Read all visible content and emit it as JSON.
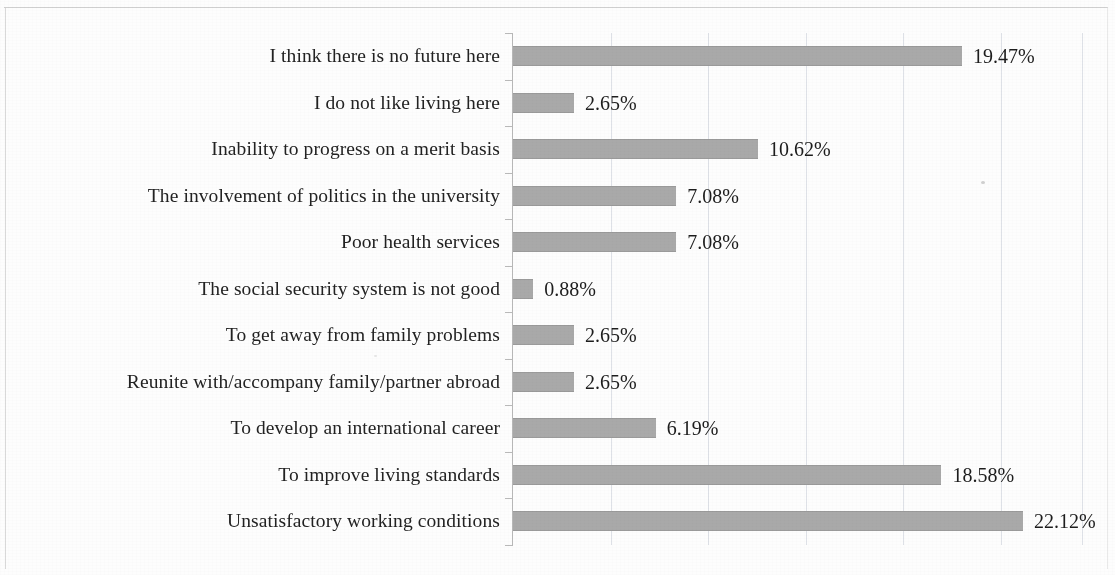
{
  "chart_data": {
    "type": "bar",
    "orientation": "horizontal",
    "title": "",
    "subtitle": "",
    "xlabel": "",
    "ylabel": "",
    "categories": [
      "I think there is no future here",
      "I do not like living here",
      "Inability to progress on a merit basis",
      "The involvement of politics in the university",
      "Poor health services",
      "The social security system is not good",
      "To get away from family problems",
      "Reunite with/accompany family/partner abroad",
      "To develop an international career",
      "To improve living standards",
      "Unsatisfactory working conditions"
    ],
    "values": [
      19.47,
      2.65,
      10.62,
      7.08,
      7.08,
      0.88,
      2.65,
      2.65,
      6.19,
      18.58,
      22.12
    ],
    "value_labels": [
      "19.47%",
      "2.65%",
      "10.62%",
      "7.08%",
      "7.08%",
      "0.88%",
      "2.65%",
      "2.65%",
      "6.19%",
      "18.58%",
      "22.12%"
    ],
    "unit": "%",
    "xlim": [
      0,
      24.675
    ],
    "gridline_values": [
      4.23,
      8.46,
      12.69,
      16.92,
      21.15,
      24.67
    ],
    "grid": true,
    "grid_axis": "x",
    "legend": false,
    "tick_labels_x": [],
    "series": [
      {
        "name": "Share of respondents",
        "color": "#a9a9a9",
        "values": [
          19.47,
          2.65,
          10.62,
          7.08,
          7.08,
          0.88,
          2.65,
          2.65,
          6.19,
          18.58,
          22.12
        ]
      }
    ]
  },
  "colors": {
    "bar": "#a9a9a9",
    "gridline": "#d8dce3",
    "axis": "#b9b9b9",
    "text": "#1d1d1d",
    "page": "#fdfdfd",
    "page_border": "#c9c9c9"
  }
}
